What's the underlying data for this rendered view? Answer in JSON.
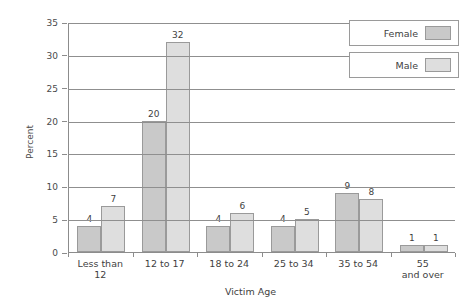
{
  "chart_data": {
    "type": "bar",
    "title": "",
    "xlabel": "Victim Age",
    "ylabel": "Percent",
    "categories": [
      "Less than 12",
      "12 to 17",
      "18 to 24",
      "25 to 34",
      "35 to 54",
      "55 and over"
    ],
    "category_lines": [
      [
        "Less than",
        "12"
      ],
      [
        "12 to 17",
        ""
      ],
      [
        "18 to 24",
        ""
      ],
      [
        "25 to 34",
        ""
      ],
      [
        "35 to 54",
        ""
      ],
      [
        "55",
        "and over"
      ]
    ],
    "series": [
      {
        "name": "Female",
        "color": "#c9c9c9",
        "values": [
          4,
          20,
          4,
          4,
          9,
          1
        ]
      },
      {
        "name": "Male",
        "color": "#dedede",
        "values": [
          7,
          32,
          6,
          5,
          8,
          1
        ]
      }
    ],
    "ylim": [
      0,
      35
    ],
    "ytick_labels": [
      "0",
      "5",
      "10",
      "15",
      "20",
      "25",
      "30",
      "35"
    ],
    "ytick_values": [
      0,
      5,
      10,
      15,
      20,
      25,
      30,
      35
    ],
    "grid": true,
    "legend_position": "top-right"
  },
  "legend": {
    "entries": [
      {
        "label": "Female"
      },
      {
        "label": "Male"
      }
    ]
  },
  "axes": {
    "y_title": "Percent",
    "x_title": "Victim Age"
  }
}
